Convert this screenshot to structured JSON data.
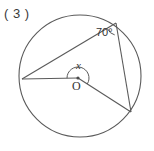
{
  "figure": {
    "problem_label": "( 3 )",
    "type": "circle-geometry-diagram",
    "labels": {
      "inscribed_angle": "70°",
      "unknown_angle": "x",
      "center": "O"
    },
    "colors": {
      "stroke": "#555555",
      "background": "#ffffff",
      "text": "#333333"
    },
    "geometry": {
      "circle": {
        "cx": 80,
        "cy": 76,
        "r": 61
      },
      "center_point": {
        "x": 78,
        "y": 78
      },
      "points": {
        "A_left": {
          "x": 22,
          "y": 79
        },
        "B_top_right": {
          "x": 116,
          "y": 23
        },
        "C_bottom_right": {
          "x": 131,
          "y": 112
        }
      },
      "chords": [
        {
          "from": "A_left",
          "to": "B_top_right"
        },
        {
          "from": "B_top_right",
          "to": "C_bottom_right"
        }
      ],
      "radii": [
        {
          "from": "center_point",
          "to": "A_left"
        },
        {
          "from": "center_point",
          "to": "C_bottom_right"
        }
      ],
      "arcs": [
        {
          "at": "B_top_right",
          "measure": "70°",
          "kind": "inscribed-angle-mark"
        },
        {
          "at": "center_point",
          "measure": "x",
          "kind": "central-angle-mark-reflex"
        }
      ]
    }
  }
}
